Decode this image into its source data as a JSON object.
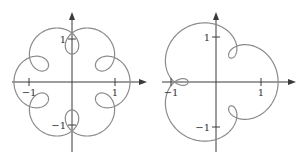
{
  "chart_data": [
    {
      "type": "line",
      "title": "",
      "description": "Parametric curve with 6-fold symmetry and six inner loops: z(t) = e^{it} + 0.35 e^{7it}",
      "param": {
        "a": 1,
        "b": 0.35,
        "k": 7
      },
      "xlim": [
        -1.4,
        1.75
      ],
      "ylim": [
        -1.6,
        1.6
      ],
      "xticks": [
        {
          "value": -1,
          "label": "−1"
        },
        {
          "value": 1,
          "label": "1"
        }
      ],
      "yticks": [
        {
          "value": 1,
          "label": "1"
        },
        {
          "value": -1,
          "label": "−1"
        }
      ],
      "grid": false,
      "color": "#8a8a8a"
    },
    {
      "type": "line",
      "title": "",
      "description": "Parametric curve with 3-fold symmetry and three inner loops: z(t) = e^{it} + 0.38 e^{4it}",
      "param": {
        "a": 1,
        "b": 0.38,
        "k": 4
      },
      "xlim": [
        -1.1,
        1.75
      ],
      "ylim": [
        -1.6,
        1.6
      ],
      "xticks": [
        {
          "value": -1,
          "label": "−1"
        },
        {
          "value": 1,
          "label": "1"
        }
      ],
      "yticks": [
        {
          "value": 1,
          "label": "1"
        },
        {
          "value": -1,
          "label": "−1"
        }
      ],
      "grid": false,
      "color": "#8a8a8a"
    }
  ]
}
